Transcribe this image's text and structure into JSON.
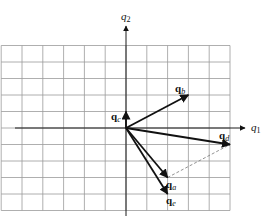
{
  "diagram": {
    "axes": {
      "x_label": "q",
      "x_sub": "1",
      "y_label": "q",
      "y_sub": "2"
    },
    "grid": {
      "x_range": [
        -6,
        5
      ],
      "y_range": [
        -5,
        5
      ],
      "cell_px": [
        20.8,
        16.5
      ],
      "origin_px": [
        126,
        128
      ]
    },
    "vectors": [
      {
        "name": "q_a",
        "label": "q",
        "sub": "a",
        "tip": [
          2,
          -3
        ]
      },
      {
        "name": "q_b",
        "label": "q",
        "sub": "b",
        "tip": [
          3,
          2
        ]
      },
      {
        "name": "q_c",
        "label": "q",
        "sub": "c",
        "tip": [
          0,
          1
        ]
      },
      {
        "name": "q_d",
        "label": "q",
        "sub": "d",
        "tip": [
          5,
          -1
        ]
      },
      {
        "name": "q_e",
        "label": "q",
        "sub": "e",
        "tip": [
          2,
          -4
        ]
      }
    ],
    "dashed_segment": {
      "from": [
        2,
        -3
      ],
      "to": [
        5,
        -1
      ]
    }
  }
}
